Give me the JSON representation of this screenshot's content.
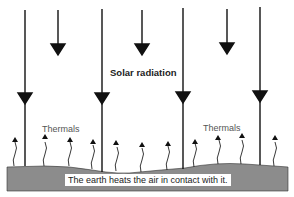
{
  "diagram": {
    "title": "Solar radiation",
    "labels": {
      "thermals_left": "Thermals",
      "thermals_right": "Thermals"
    },
    "caption": "The earth heats the air in contact with it.",
    "colors": {
      "ground": "#8c8c8c",
      "arrows": "#111111",
      "background": "#ffffff"
    },
    "long_arrows_x": [
      25,
      102,
      183,
      260
    ],
    "short_arrows_x": [
      58,
      142,
      227
    ],
    "thermal_arrows_x": [
      15,
      45,
      70,
      93,
      116,
      142,
      168,
      195,
      218,
      242,
      275
    ]
  }
}
